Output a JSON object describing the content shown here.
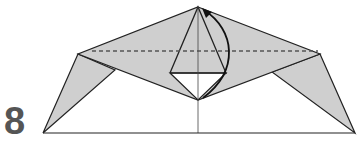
{
  "step": {
    "number": "8"
  },
  "colors": {
    "paper": "#cfcfcf",
    "line": "#222222",
    "dash": "#555555",
    "step_number": "#555555"
  },
  "diagram": {
    "symbols": [
      "valley-fold-line",
      "fold-arrow",
      "center-crease"
    ]
  }
}
